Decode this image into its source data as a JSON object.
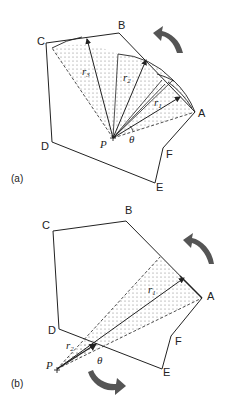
{
  "figure": {
    "panels": [
      {
        "id": "a",
        "caption": "(a)",
        "vertices": {
          "A": "A",
          "B": "B",
          "C": "C",
          "D": "D",
          "E": "E",
          "F": "F"
        },
        "point": "P",
        "radii": [
          "r",
          "r",
          "r"
        ],
        "radii_subscripts": [
          "1",
          "2",
          "3"
        ],
        "angle": "θ",
        "rotation": "counterclockwise"
      },
      {
        "id": "b",
        "caption": "(b)",
        "vertices": {
          "A": "A",
          "B": "B",
          "C": "C",
          "D": "D",
          "E": "E",
          "F": "F"
        },
        "point": "P",
        "radii": [
          "r",
          "r"
        ],
        "radii_subscripts": [
          "1",
          "2"
        ],
        "angle": "θ",
        "rotation": "counterclockwise and clockwise"
      }
    ],
    "colors": {
      "stroke": "#222222",
      "arrow": "#555555",
      "dots": "#777777"
    }
  }
}
